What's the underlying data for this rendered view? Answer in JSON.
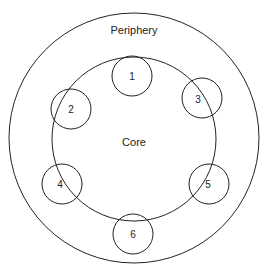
{
  "diagram": {
    "outer_label": "Periphery",
    "inner_label": "Core",
    "stroke_color": "#222222",
    "background": "#ffffff",
    "nodes": [
      {
        "label": "1",
        "cx": 132,
        "cy": 76
      },
      {
        "label": "2",
        "cx": 71,
        "cy": 109
      },
      {
        "label": "3",
        "cx": 202,
        "cy": 98
      },
      {
        "label": "4",
        "cx": 62,
        "cy": 184
      },
      {
        "label": "5",
        "cx": 209,
        "cy": 184
      },
      {
        "label": "6",
        "cx": 133,
        "cy": 234
      }
    ]
  }
}
